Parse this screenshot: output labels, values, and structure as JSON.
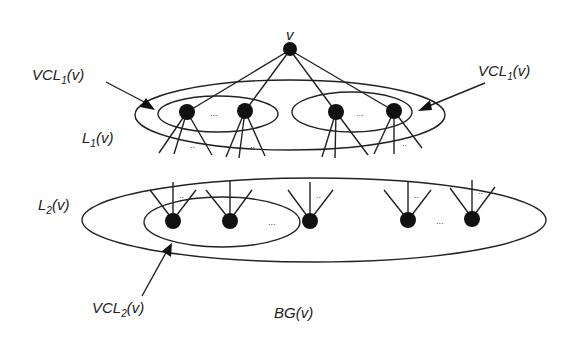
{
  "diagram": {
    "colors": {
      "stroke": "#222222",
      "node": "#111111",
      "background": "#ffffff"
    },
    "root": {
      "label": "v",
      "x": 290,
      "y": 48
    },
    "labels": {
      "vcl1_left": {
        "main": "VCL",
        "sub": "1",
        "arg": "(v)"
      },
      "vcl1_right": {
        "main": "VCL",
        "sub": "1",
        "arg": "(v)"
      },
      "l1": {
        "main": "L",
        "sub": "1",
        "arg": "(v)"
      },
      "l2": {
        "main": "L",
        "sub": "2",
        "arg": "(v)"
      },
      "vcl2": {
        "main": "VCL",
        "sub": "2",
        "arg": "(v)"
      },
      "bg": {
        "text": "BG(v)"
      }
    },
    "ellipsis": "...",
    "ellipsis_small": ".."
  }
}
